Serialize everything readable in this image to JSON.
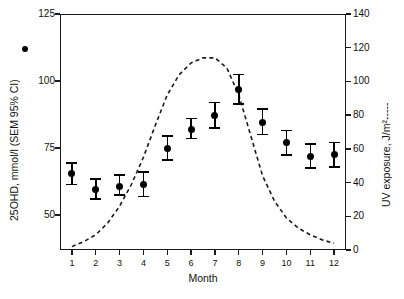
{
  "chart_data": {
    "type": "scatter",
    "title": "",
    "xlabel": "Month",
    "ylabel": "25OHD, mmol/l (SEM 95% CI)",
    "y2label": "UV exposure, J/m²",
    "categories": [
      "1",
      "2",
      "3",
      "4",
      "5",
      "6",
      "7",
      "8",
      "9",
      "10",
      "11",
      "12"
    ],
    "x": [
      1,
      2,
      3,
      4,
      5,
      6,
      7,
      8,
      9,
      10,
      11,
      12
    ],
    "ylim": [
      37,
      125
    ],
    "y2lim": [
      0,
      140
    ],
    "xlim": [
      0.5,
      12.5
    ],
    "grid": false,
    "legend_position": "axis-titles",
    "series": [
      {
        "name": "25OHD, mmol/l (SEM 95% CI)",
        "axis": "left",
        "marker": "filled-circle",
        "style": "points-with-error-bars",
        "values": [
          65.5,
          59.5,
          60.5,
          61.5,
          75.0,
          82.0,
          87.0,
          97.0,
          84.5,
          77.0,
          72.0,
          72.5
        ],
        "err_low": [
          61.5,
          56.0,
          57.5,
          57.0,
          70.5,
          78.5,
          82.5,
          91.5,
          80.0,
          72.5,
          67.5,
          68.0
        ],
        "err_high": [
          69.5,
          63.5,
          65.0,
          66.0,
          79.5,
          86.0,
          92.0,
          102.5,
          89.5,
          81.5,
          76.5,
          77.0
        ]
      },
      {
        "name": "UV exposure, J/m²",
        "axis": "right",
        "marker": "none",
        "style": "dashed-line",
        "x": [
          1.0,
          1.5,
          2.0,
          2.5,
          3.0,
          3.5,
          4.0,
          4.5,
          5.0,
          5.5,
          6.0,
          6.5,
          7.0,
          7.5,
          8.0,
          8.5,
          9.0,
          9.5,
          10.0,
          10.5,
          11.0,
          11.5,
          12.0
        ],
        "values": [
          2,
          5,
          9,
          16,
          26,
          39,
          55,
          74,
          92,
          104,
          111,
          114,
          114,
          108,
          92,
          68,
          44,
          29,
          19,
          13,
          9,
          6,
          4
        ]
      }
    ],
    "yticks": [
      50,
      75,
      100,
      125
    ],
    "y2ticks": [
      0,
      20,
      40,
      60,
      80,
      100,
      120,
      140
    ],
    "xticks": [
      1,
      2,
      3,
      4,
      5,
      6,
      7,
      8,
      9,
      10,
      11,
      12
    ],
    "colors": {
      "marker": "#000000",
      "line": "#1a1a1a",
      "axis": "#1a1a1a",
      "background": "#ffffff"
    }
  }
}
